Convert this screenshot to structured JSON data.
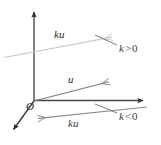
{
  "figure": {
    "colors": {
      "axis": "#4a4a4a",
      "dark_axis": "#333333",
      "vector_u": "#777777",
      "vector_ku_positive": "#c9c9c9",
      "vector_ku_negative": "#8a8a8a",
      "leader_line": "#6b6b6b",
      "text": "#2b2b2b",
      "background": "#ffffff"
    },
    "labels": {
      "origin": "O",
      "vector_u": "u",
      "vector_ku_positive": "ku",
      "vector_ku_negative": "ku",
      "condition_positive_k": "k",
      "condition_positive_rel": ">",
      "condition_positive_value": "0",
      "condition_negative_k": "k",
      "condition_negative_rel": "<",
      "condition_negative_value": "0"
    },
    "geometry": {
      "origin": {
        "x": 34,
        "y": 101
      },
      "y_axis_tip": {
        "x": 34,
        "y": 6
      },
      "x_axis_tip": {
        "x": 150,
        "y": 100
      },
      "z_axis_tip": {
        "x": 9,
        "y": 134
      },
      "u_tip": {
        "x": 116,
        "y": 81
      },
      "ku_positive_start": {
        "x": 4,
        "y": 57
      },
      "ku_positive_tip": {
        "x": 119,
        "y": 36
      },
      "ku_negative_start": {
        "x": 147,
        "y": 107
      },
      "ku_negative_tip": {
        "x": 31,
        "y": 119
      }
    }
  }
}
